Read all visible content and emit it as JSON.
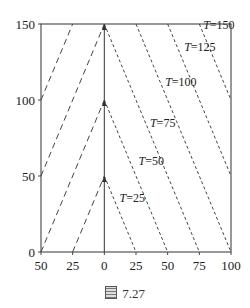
{
  "caption": {
    "icon": "figure-icon",
    "text": "7.27"
  },
  "chart_data": {
    "type": "line",
    "title": "",
    "xlabel": "",
    "ylabel": "",
    "x_tick_labels": [
      "50",
      "25",
      "0",
      "25",
      "50",
      "75",
      "100"
    ],
    "x_tick_values": [
      -50,
      -25,
      0,
      25,
      50,
      75,
      100
    ],
    "y_tick_labels": [
      "0",
      "50",
      "100",
      "150"
    ],
    "y_tick_values": [
      0,
      50,
      100,
      150
    ],
    "xlim": [
      -50,
      100
    ],
    "ylim": [
      0,
      150
    ],
    "grid": false,
    "axis_line": {
      "x": 0,
      "y_from": 0,
      "y_to": 150,
      "arrows_at": [
        50,
        100,
        150
      ]
    },
    "series": [
      {
        "name": "T=25",
        "style": "dotted",
        "points": [
          [
            0,
            50
          ],
          [
            25,
            0
          ]
        ]
      },
      {
        "name": "T=50",
        "style": "dotted",
        "points": [
          [
            0,
            100
          ],
          [
            50,
            0
          ]
        ]
      },
      {
        "name": "T=75",
        "style": "dotted",
        "points": [
          [
            0,
            150
          ],
          [
            75,
            0
          ]
        ]
      },
      {
        "name": "T=100",
        "style": "dotted",
        "points": [
          [
            25,
            150
          ],
          [
            100,
            0
          ]
        ]
      },
      {
        "name": "T=125",
        "style": "dotted",
        "points": [
          [
            50,
            150
          ],
          [
            100,
            50
          ]
        ]
      },
      {
        "name": "T=150",
        "style": "dotted",
        "points": [
          [
            75,
            150
          ],
          [
            100,
            100
          ]
        ]
      },
      {
        "name": "left-1",
        "style": "dashed",
        "points": [
          [
            -25,
            0
          ],
          [
            0,
            50
          ]
        ]
      },
      {
        "name": "left-2",
        "style": "dashed",
        "points": [
          [
            -50,
            0
          ],
          [
            0,
            100
          ]
        ]
      },
      {
        "name": "left-3",
        "style": "dashed",
        "points": [
          [
            -50,
            50
          ],
          [
            0,
            150
          ]
        ]
      },
      {
        "name": "left-4",
        "style": "dashed",
        "points": [
          [
            -50,
            100
          ],
          [
            -25,
            150
          ]
        ]
      }
    ],
    "annotations": [
      {
        "text": "T=25",
        "x": 12,
        "y": 33
      },
      {
        "text": "T=50",
        "x": 27,
        "y": 57
      },
      {
        "text": "T=75",
        "x": 36,
        "y": 82
      },
      {
        "text": "T=100",
        "x": 48,
        "y": 109
      },
      {
        "text": "T=125",
        "x": 63,
        "y": 132
      },
      {
        "text": "T=150",
        "x": 78,
        "y": 147
      }
    ]
  }
}
